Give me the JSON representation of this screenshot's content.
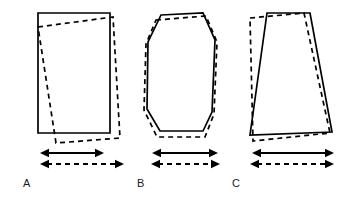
{
  "figure": {
    "title": "",
    "background_color": "#ffffff",
    "ink_color": "#000000",
    "width": 352,
    "height": 198
  },
  "legend": {
    "solid_meaning": "solid outline shape",
    "dashed_meaning": "dashed outline shape"
  },
  "panels": [
    {
      "id": "A",
      "label": "A",
      "label_x": 23,
      "label_y": 187,
      "solid_shape": {
        "name": "rectangle",
        "points": "38,13 110,13 110,133 38,133",
        "closed": true
      },
      "dashed_shape": {
        "name": "tilted-rectangle",
        "points": "38,27 113,17 120,138 56,143",
        "closed": true
      },
      "solid_arrow": {
        "x1": 40,
        "x2": 104,
        "y": 153,
        "length_px": 64
      },
      "dashed_arrow": {
        "x1": 40,
        "x2": 124,
        "y": 164,
        "length_px": 84
      }
    },
    {
      "id": "B",
      "label": "B",
      "label_x": 137,
      "label_y": 187,
      "solid_shape": {
        "name": "hexagon",
        "points": "161,15 203,13 215,40 212,112 203,131 160,131 147,109 148,42",
        "closed": true
      },
      "dashed_shape": {
        "name": "hexagon-shifted",
        "points": "156,20 206,16 217,42 214,114 205,137 157,137 144,110 146,44",
        "closed": true
      },
      "solid_arrow": {
        "x1": 152,
        "x2": 218,
        "y": 153,
        "length_px": 66
      },
      "dashed_arrow": {
        "x1": 151,
        "x2": 220,
        "y": 164,
        "length_px": 69
      }
    },
    {
      "id": "C",
      "label": "C",
      "label_x": 232,
      "label_y": 187,
      "solid_shape": {
        "name": "trapezoid",
        "points": "267,13 310,13 332,132 250,135",
        "closed": true
      },
      "dashed_shape": {
        "name": "trapezoid-tilted",
        "points": "250,18 304,13 330,133 253,141",
        "closed": true
      },
      "solid_arrow": {
        "x1": 252,
        "x2": 334,
        "y": 153,
        "length_px": 82
      },
      "dashed_arrow": {
        "x1": 250,
        "x2": 334,
        "y": 164,
        "length_px": 84
      }
    }
  ]
}
